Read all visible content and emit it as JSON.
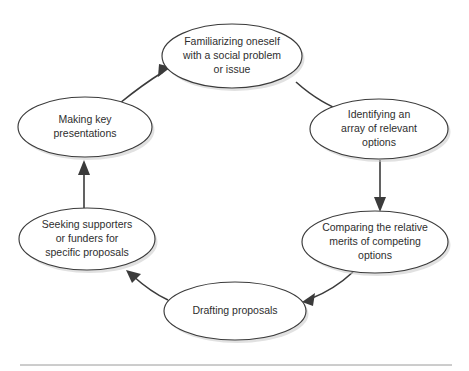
{
  "figure": {
    "type": "cycle-diagram",
    "node_count": 6,
    "shape": "ellipse",
    "colors": {
      "node_fill": "#ffffff",
      "node_stroke": "#3b3b3b",
      "arrow": "#3b3b3b",
      "text": "#2e2e2e",
      "shadow": "#c9c9c9",
      "rule": "#9a9a9a",
      "background": "#ffffff"
    }
  },
  "nodes": [
    {
      "id": "familiarizing",
      "name": "familiarizing-oneself",
      "lines": [
        "Familiarizing oneself",
        "with a social problem",
        "or issue"
      ],
      "cx": 232,
      "cy": 56,
      "rx": 70,
      "ry": 32
    },
    {
      "id": "identifying",
      "name": "identifying-options",
      "lines": [
        "Identifying an",
        "array of relevant",
        "options"
      ],
      "cx": 379,
      "cy": 129,
      "rx": 69,
      "ry": 30
    },
    {
      "id": "comparing",
      "name": "comparing-merits",
      "lines": [
        "Comparing the relative",
        "merits of competing",
        "options"
      ],
      "cx": 375,
      "cy": 242,
      "rx": 73,
      "ry": 31
    },
    {
      "id": "drafting",
      "name": "drafting-proposals",
      "lines": [
        "Drafting proposals"
      ],
      "cx": 235,
      "cy": 311,
      "rx": 71,
      "ry": 29
    },
    {
      "id": "seeking",
      "name": "seeking-supporters",
      "lines": [
        "Seeking supporters",
        "or funders for",
        "specific proposals"
      ],
      "cx": 87,
      "cy": 239,
      "rx": 68,
      "ry": 31
    },
    {
      "id": "presentations",
      "name": "making-presentations",
      "lines": [
        "Making key",
        "presentations"
      ],
      "cx": 85,
      "cy": 127,
      "rx": 67,
      "ry": 30
    }
  ],
  "arrows": [
    {
      "name": "arrow-familiarizing-to-identifying",
      "from": "familiarizing",
      "to": "identifying",
      "path": "M 296,82 C 315,99 330,106 344,112",
      "head": "346,113 334,108 338,120"
    },
    {
      "name": "arrow-identifying-to-comparing",
      "from": "identifying",
      "to": "comparing",
      "path": "M 380,160 L 380,205",
      "head": "380,212 374,197 386,197"
    },
    {
      "name": "arrow-comparing-to-drafting",
      "from": "comparing",
      "to": "drafting",
      "path": "M 353,272 C 338,286 323,294 310,299",
      "head": "302,302 315,293 313,306"
    },
    {
      "name": "arrow-drafting-to-seeking",
      "from": "drafting",
      "to": "seeking",
      "path": "M 168,300 C 155,294 143,285 133,276",
      "head": "126,270 141,274 132,283"
    },
    {
      "name": "arrow-seeking-to-presentations",
      "from": "seeking",
      "to": "presentations",
      "path": "M 84,208 L 84,168",
      "head": "84,160 90,175 78,175"
    },
    {
      "name": "arrow-presentations-to-familiarizing",
      "from": "presentations",
      "to": "familiarizing",
      "path": "M 120,103 C 136,90 150,80 163,72",
      "head": "171,67 158,77 159,64"
    }
  ],
  "footer_rule": {
    "name": "footer-divider",
    "x1": 20,
    "x2": 452,
    "y": 365
  }
}
